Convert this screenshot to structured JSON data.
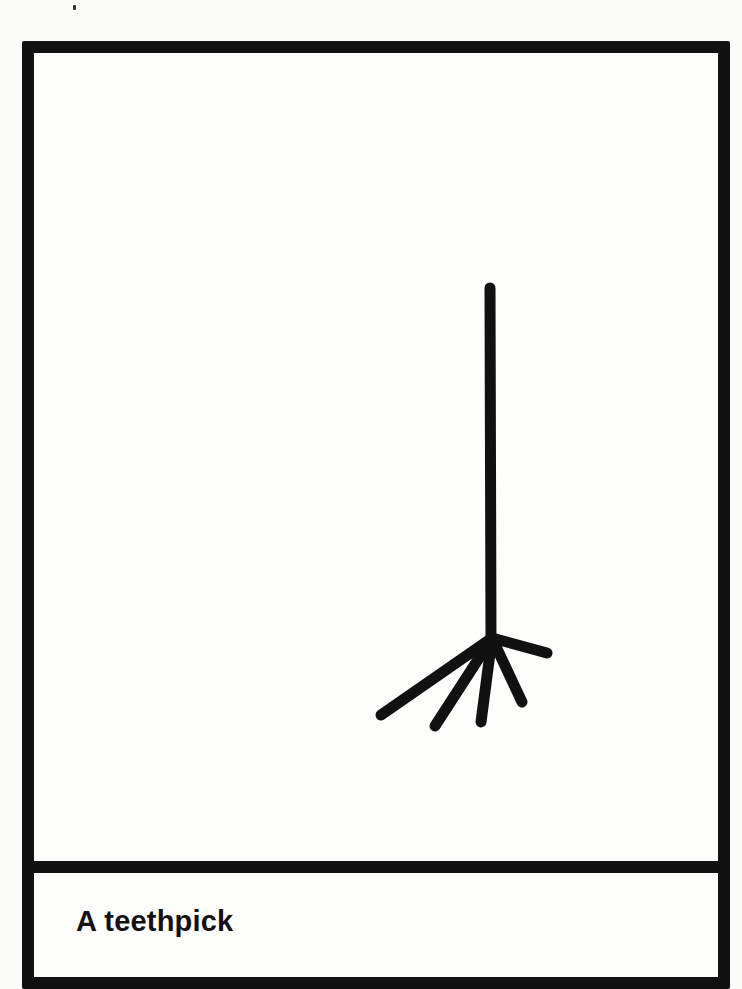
{
  "card": {
    "caption": "A teethpick",
    "border_color": "#111111",
    "background_color": "#fdfdfc"
  },
  "illustration": {
    "subject": "toothpick-with-teeth-like-bristles",
    "stroke_color": "#111111",
    "handle": {
      "x": 478,
      "y_top": 276,
      "y_bottom": 625
    },
    "bristles": [
      {
        "x1": 480,
        "y1": 626,
        "x2": 369,
        "y2": 703
      },
      {
        "x1": 480,
        "y1": 626,
        "x2": 423,
        "y2": 714
      },
      {
        "x1": 480,
        "y1": 626,
        "x2": 469,
        "y2": 710
      },
      {
        "x1": 480,
        "y1": 626,
        "x2": 510,
        "y2": 690
      },
      {
        "x1": 480,
        "y1": 626,
        "x2": 535,
        "y2": 641
      }
    ]
  }
}
